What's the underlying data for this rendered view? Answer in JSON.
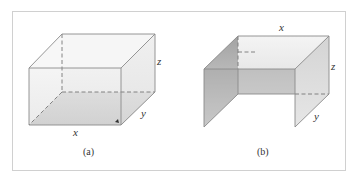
{
  "figure": {
    "panels": [
      {
        "id": "a",
        "caption": "(a)",
        "description": "Closed rectangular box with shaded bottom",
        "labels": {
          "x": "x",
          "y": "y",
          "z": "z"
        }
      },
      {
        "id": "b",
        "caption": "(b)",
        "description": "Open box with top, back, left and right faces only",
        "labels": {
          "x": "x",
          "y": "y",
          "z": "z"
        }
      }
    ],
    "colors": {
      "edge": "#8a8a8a",
      "floor_shade": "#b4b4b4",
      "face_light": "#ececec",
      "wall_dark": "#a6a6a6",
      "wall_light": "#e2e2e2",
      "frame": "#d0d0d0"
    }
  }
}
